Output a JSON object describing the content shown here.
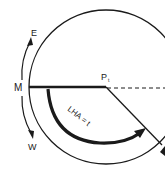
{
  "diagram": {
    "labels": {
      "east": "E",
      "west": "W",
      "meridian": "M",
      "pole": "P",
      "pole_subscript": "t",
      "angle": "LHA = t"
    },
    "colors": {
      "line": "#1a1a1a",
      "background": "#ffffff"
    }
  }
}
